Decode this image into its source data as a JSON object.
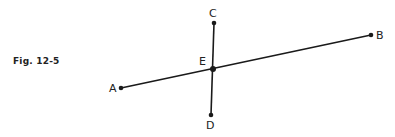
{
  "figure": {
    "caption": "Fig. 12-5"
  },
  "points": {
    "A": {
      "label": "A",
      "x": 121,
      "y": 88
    },
    "B": {
      "label": "B",
      "x": 371,
      "y": 35
    },
    "C": {
      "label": "C",
      "x": 214,
      "y": 23
    },
    "D": {
      "label": "D",
      "x": 211,
      "y": 115
    },
    "E": {
      "label": "E",
      "x": 213,
      "y": 69
    }
  },
  "segments": [
    {
      "name": "AB",
      "from": "A",
      "to": "B"
    },
    {
      "name": "CD",
      "from": "C",
      "to": "D"
    }
  ],
  "colors": {
    "line": "#1a1a1a",
    "text": "#222222",
    "background": "#ffffff"
  }
}
